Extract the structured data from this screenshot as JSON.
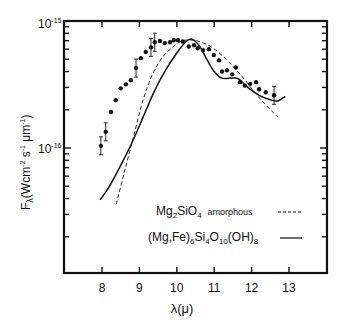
{
  "chart_data": {
    "type": "line",
    "title": "",
    "xlabel": "λ(μ)",
    "ylabel": "F_λ (W cm^-2 s^-1 μm^-1)",
    "xlim": [
      6.95,
      14.0
    ],
    "ylim": [
      1.05e-17,
      1e-15
    ],
    "yscale": "log",
    "grid": false,
    "legend_position": "lower right (inside)",
    "x_ticks": [
      8,
      9,
      10,
      11,
      12,
      13
    ],
    "x_tick_labels": [
      "8",
      "9",
      "10",
      "11",
      "12",
      "13"
    ],
    "y_tick_labels": [
      {
        "value": 1e-15,
        "label": "10^-15"
      },
      {
        "value": 1e-16,
        "label": "10^-16"
      }
    ],
    "series": [
      {
        "name": "observed",
        "style": "points",
        "x": [
          7.97,
          8.1,
          8.24,
          8.37,
          8.5,
          8.64,
          8.77,
          8.91,
          9.04,
          9.17,
          9.31,
          9.41,
          9.55,
          9.68,
          9.82,
          9.92,
          10.03,
          10.16,
          10.32,
          10.46,
          10.56,
          10.7,
          10.86,
          10.99,
          11.13,
          11.21,
          11.34,
          11.48,
          11.58,
          11.69,
          11.82,
          11.96,
          12.12,
          12.2,
          12.38,
          12.6
        ],
        "y": [
          1.04e-16,
          1.34e-16,
          1.92e-16,
          2.38e-16,
          2.95e-16,
          3.17e-16,
          3.42e-16,
          4.26e-16,
          5.1e-16,
          5.71e-16,
          6.2e-16,
          6.8e-16,
          6.95e-16,
          6.7e-16,
          6.8e-16,
          7.05e-16,
          7.05e-16,
          6.9e-16,
          6.3e-16,
          6.45e-16,
          6.1e-16,
          5.9e-16,
          6e-16,
          5.4e-16,
          4.9e-16,
          4e-16,
          4.1e-16,
          3.8e-16,
          4.3e-16,
          3.3e-16,
          3.1e-16,
          3.2e-16,
          3.3e-16,
          2.9e-16,
          2.75e-16,
          2.6e-16
        ],
        "error_bars_at_x": [
          7.97,
          8.1,
          8.91,
          9.31,
          9.41,
          12.6
        ]
      },
      {
        "name": "Mg2SiO4 amorphous",
        "style": "dashed",
        "x": [
          8.38,
          8.6,
          8.85,
          9.1,
          9.35,
          9.6,
          9.85,
          10.1,
          10.35,
          10.6,
          10.9,
          11.2,
          11.5,
          11.8,
          12.1,
          12.4,
          12.7
        ],
        "y": [
          3.6e-17,
          6.5e-17,
          1.25e-16,
          2.4e-16,
          3.8e-16,
          5.1e-16,
          6.1e-16,
          6.9e-16,
          7.1e-16,
          6.9e-16,
          6.3e-16,
          5.4e-16,
          4.4e-16,
          3.5e-16,
          2.7e-16,
          2.15e-16,
          1.75e-16
        ]
      },
      {
        "name": "(Mg,Fe)6Si4O10(OH)8",
        "style": "solid",
        "x": [
          7.95,
          8.2,
          8.5,
          8.8,
          9.1,
          9.4,
          9.7,
          10.0,
          10.25,
          10.4,
          10.6,
          10.8,
          11.0,
          11.2,
          11.45,
          11.65,
          11.9,
          12.2,
          12.5,
          12.7,
          12.9
        ],
        "y": [
          3.9e-17,
          5e-17,
          7.3e-17,
          1.1e-16,
          1.75e-16,
          2.8e-16,
          4.1e-16,
          5.6e-16,
          6.9e-16,
          7.2e-16,
          6.4e-16,
          5e-16,
          4e-16,
          3.55e-16,
          3.55e-16,
          3.5e-16,
          3e-16,
          2.6e-16,
          2.4e-16,
          2.35e-16,
          2.55e-16
        ]
      }
    ]
  },
  "axes": {
    "y_top_label_base": "10",
    "y_top_label_exp": "-15",
    "y_mid_label_base": "10",
    "y_mid_label_exp": "-16",
    "y_title_main": "F",
    "y_title_sub": "λ",
    "y_title_unit": "(Wcm",
    "y_title_exp1": "-2",
    "y_title_s": "s",
    "y_title_exp2": "-1",
    "y_title_um": "μm",
    "y_title_exp3": "-1",
    "y_title_close": ")",
    "x_title": "λ(μ)"
  },
  "legend": {
    "item1_formula_parts": [
      "Mg",
      "2",
      "SiO",
      "4"
    ],
    "item1_suffix": "amorphous",
    "item2_formula_parts": [
      "(Mg,Fe)",
      "6",
      "Si",
      "4",
      "O",
      "10",
      "(OH)",
      "8"
    ]
  }
}
